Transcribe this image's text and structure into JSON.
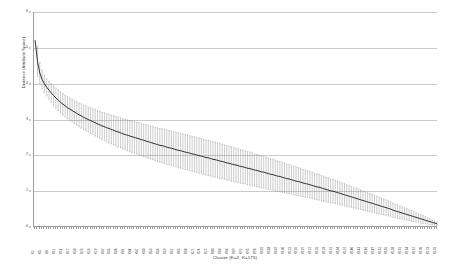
{
  "chart_data": {
    "type": "scatter",
    "title": "",
    "xlabel": "Cluster (K=2, K=175)",
    "ylabel": "Distance (Attribute Space)",
    "ylim": [
      0,
      6
    ],
    "yticks": [
      0,
      1,
      2,
      3,
      4,
      5,
      6
    ],
    "ytick_labels": [
      "0",
      "1",
      "2",
      "3",
      "4",
      "5",
      "6"
    ],
    "grid": true,
    "legend": false,
    "n_points": 175,
    "x_tick_prefix": "K",
    "series": [
      {
        "name": "Mean distance",
        "values": [
          5.2,
          4.62,
          4.3,
          4.12,
          4.0,
          3.9,
          3.82,
          3.74,
          3.67,
          3.6,
          3.54,
          3.48,
          3.43,
          3.38,
          3.33,
          3.29,
          3.25,
          3.21,
          3.17,
          3.13,
          3.1,
          3.06,
          3.03,
          3.0,
          2.97,
          2.94,
          2.91,
          2.88,
          2.85,
          2.82,
          2.8,
          2.77,
          2.75,
          2.72,
          2.7,
          2.67,
          2.65,
          2.63,
          2.6,
          2.58,
          2.56,
          2.54,
          2.52,
          2.5,
          2.48,
          2.46,
          2.44,
          2.42,
          2.4,
          2.38,
          2.36,
          2.34,
          2.32,
          2.3,
          2.28,
          2.27,
          2.25,
          2.23,
          2.21,
          2.2,
          2.18,
          2.16,
          2.14,
          2.13,
          2.11,
          2.09,
          2.08,
          2.06,
          2.04,
          2.03,
          2.01,
          1.99,
          1.98,
          1.96,
          1.94,
          1.93,
          1.91,
          1.89,
          1.88,
          1.86,
          1.84,
          1.83,
          1.81,
          1.79,
          1.78,
          1.76,
          1.74,
          1.73,
          1.71,
          1.69,
          1.68,
          1.66,
          1.64,
          1.63,
          1.61,
          1.59,
          1.58,
          1.56,
          1.54,
          1.53,
          1.51,
          1.49,
          1.47,
          1.46,
          1.44,
          1.42,
          1.41,
          1.39,
          1.37,
          1.35,
          1.34,
          1.32,
          1.3,
          1.28,
          1.27,
          1.25,
          1.23,
          1.21,
          1.2,
          1.18,
          1.16,
          1.14,
          1.12,
          1.11,
          1.09,
          1.07,
          1.05,
          1.03,
          1.01,
          1.0,
          0.98,
          0.96,
          0.94,
          0.92,
          0.9,
          0.88,
          0.86,
          0.84,
          0.82,
          0.8,
          0.78,
          0.76,
          0.74,
          0.72,
          0.7,
          0.68,
          0.66,
          0.64,
          0.62,
          0.6,
          0.58,
          0.56,
          0.54,
          0.52,
          0.5,
          0.47,
          0.45,
          0.43,
          0.41,
          0.39,
          0.37,
          0.35,
          0.33,
          0.31,
          0.29,
          0.27,
          0.25,
          0.23,
          0.21,
          0.19,
          0.17,
          0.15,
          0.13,
          0.11,
          0.09
        ],
        "errors": [
          0.0,
          0.42,
          0.3,
          0.26,
          0.24,
          0.24,
          0.25,
          0.26,
          0.27,
          0.28,
          0.29,
          0.29,
          0.3,
          0.3,
          0.31,
          0.31,
          0.32,
          0.32,
          0.33,
          0.33,
          0.34,
          0.34,
          0.35,
          0.35,
          0.36,
          0.36,
          0.37,
          0.37,
          0.38,
          0.38,
          0.39,
          0.39,
          0.4,
          0.4,
          0.41,
          0.41,
          0.42,
          0.42,
          0.42,
          0.43,
          0.43,
          0.43,
          0.44,
          0.44,
          0.44,
          0.45,
          0.45,
          0.45,
          0.46,
          0.46,
          0.46,
          0.46,
          0.47,
          0.47,
          0.47,
          0.47,
          0.48,
          0.48,
          0.48,
          0.48,
          0.48,
          0.48,
          0.49,
          0.49,
          0.49,
          0.49,
          0.49,
          0.49,
          0.49,
          0.49,
          0.49,
          0.49,
          0.49,
          0.49,
          0.49,
          0.49,
          0.49,
          0.49,
          0.49,
          0.49,
          0.49,
          0.48,
          0.48,
          0.48,
          0.48,
          0.48,
          0.48,
          0.47,
          0.47,
          0.47,
          0.47,
          0.46,
          0.46,
          0.46,
          0.46,
          0.45,
          0.45,
          0.45,
          0.45,
          0.44,
          0.44,
          0.44,
          0.43,
          0.43,
          0.43,
          0.42,
          0.42,
          0.42,
          0.41,
          0.41,
          0.41,
          0.4,
          0.4,
          0.4,
          0.39,
          0.39,
          0.38,
          0.38,
          0.38,
          0.37,
          0.37,
          0.36,
          0.36,
          0.36,
          0.35,
          0.35,
          0.34,
          0.34,
          0.33,
          0.33,
          0.33,
          0.32,
          0.32,
          0.31,
          0.31,
          0.3,
          0.3,
          0.29,
          0.29,
          0.28,
          0.28,
          0.27,
          0.27,
          0.26,
          0.26,
          0.25,
          0.25,
          0.24,
          0.24,
          0.23,
          0.23,
          0.22,
          0.22,
          0.21,
          0.2,
          0.2,
          0.19,
          0.19,
          0.18,
          0.17,
          0.17,
          0.16,
          0.15,
          0.15,
          0.14,
          0.13,
          0.12,
          0.12,
          0.11,
          0.1,
          0.09,
          0.08,
          0.07,
          0.06,
          0.05
        ]
      }
    ]
  }
}
